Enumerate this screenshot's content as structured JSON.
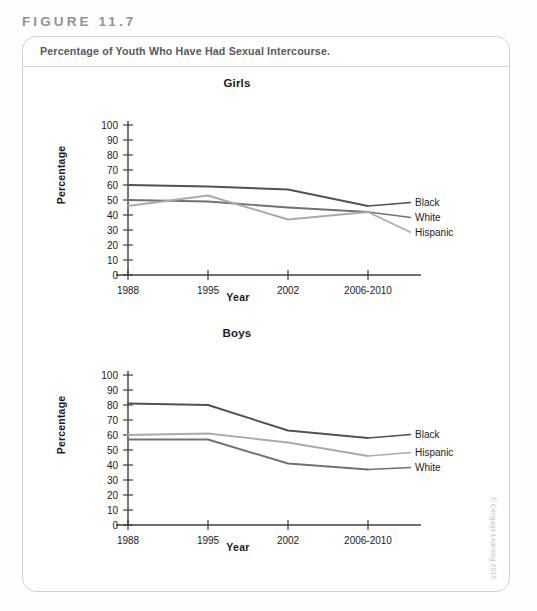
{
  "figure": {
    "number_label": "FIGURE 11.7",
    "caption": "Percentage of Youth Who Have Had Sexual Intercourse.",
    "copyright": "© Cengage Learning 2015"
  },
  "colors": {
    "black_line": "#4f5356",
    "white_line": "#6e7276",
    "hispanic_line": "#a7abae",
    "axis": "#3c3f42",
    "card_border": "#cfd3d6",
    "caption_text": "#55595c",
    "figure_label": "#8e9396"
  },
  "chart_data": [
    {
      "type": "line",
      "title": "Girls",
      "xlabel": "Year",
      "ylabel": "Percentage",
      "categories": [
        "1988",
        "1995",
        "2002",
        "2006-2010"
      ],
      "yticks": [
        0,
        10,
        20,
        30,
        40,
        50,
        60,
        70,
        80,
        90,
        100
      ],
      "ylim": [
        0,
        100
      ],
      "grid": false,
      "legend_position": "right-inline",
      "series": [
        {
          "name": "Black",
          "values": [
            60,
            59,
            57,
            46
          ]
        },
        {
          "name": "White",
          "values": [
            50,
            49,
            45,
            42
          ]
        },
        {
          "name": "Hispanic",
          "values": [
            46,
            53,
            37,
            42
          ]
        }
      ]
    },
    {
      "type": "line",
      "title": "Boys",
      "xlabel": "Year",
      "ylabel": "Percentage",
      "categories": [
        "1988",
        "1995",
        "2002",
        "2006-2010"
      ],
      "yticks": [
        0,
        10,
        20,
        30,
        40,
        50,
        60,
        70,
        80,
        90,
        100
      ],
      "ylim": [
        0,
        100
      ],
      "grid": false,
      "legend_position": "right-inline",
      "series": [
        {
          "name": "Black",
          "values": [
            81,
            80,
            63,
            58
          ]
        },
        {
          "name": "Hispanic",
          "values": [
            60,
            61,
            55,
            46
          ]
        },
        {
          "name": "White",
          "values": [
            57,
            57,
            41,
            37
          ]
        }
      ]
    }
  ]
}
